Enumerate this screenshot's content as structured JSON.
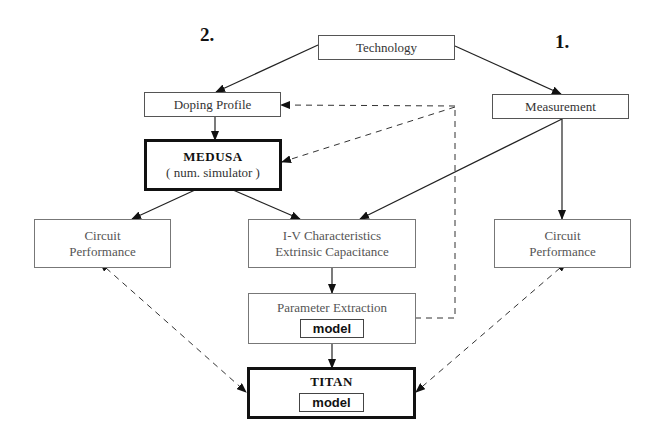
{
  "labels": {
    "approach_2": "2.",
    "approach_1": "1."
  },
  "nodes": {
    "technology": {
      "text": "Technology"
    },
    "doping_profile": {
      "text": "Doping Profile"
    },
    "measurement": {
      "text": "Measurement"
    },
    "medusa": {
      "title": "MEDUSA",
      "subtitle": "( num. simulator )"
    },
    "circuit_perf_left": {
      "line1": "Circuit",
      "line2": "Performance"
    },
    "iv_char": {
      "line1": "I-V Characteristics",
      "line2": "Extrinsic Capacitance"
    },
    "circuit_perf_right": {
      "line1": "Circuit",
      "line2": "Performance"
    },
    "param_extraction": {
      "title": "Parameter Extraction",
      "inner": "model"
    },
    "titan": {
      "title": "TITAN",
      "inner": "model"
    }
  },
  "edges": [
    {
      "from": "technology",
      "to": "doping_profile",
      "style": "solid"
    },
    {
      "from": "technology",
      "to": "measurement",
      "style": "solid"
    },
    {
      "from": "doping_profile",
      "to": "medusa",
      "style": "solid"
    },
    {
      "from": "medusa",
      "to": "circuit_perf_left",
      "style": "solid"
    },
    {
      "from": "medusa",
      "to": "iv_char",
      "style": "solid"
    },
    {
      "from": "measurement",
      "to": "iv_char",
      "style": "solid"
    },
    {
      "from": "measurement",
      "to": "circuit_perf_right",
      "style": "solid"
    },
    {
      "from": "iv_char",
      "to": "param_extraction",
      "style": "solid"
    },
    {
      "from": "param_extraction",
      "to": "titan",
      "style": "solid"
    },
    {
      "from": "param_extraction",
      "to": "doping_profile",
      "style": "dashed"
    },
    {
      "from": "param_extraction",
      "to": "medusa",
      "style": "dashed"
    },
    {
      "from": "circuit_perf_left",
      "to": "titan",
      "style": "dashed-bidirectional"
    },
    {
      "from": "circuit_perf_right",
      "to": "titan",
      "style": "dashed-bidirectional"
    }
  ]
}
